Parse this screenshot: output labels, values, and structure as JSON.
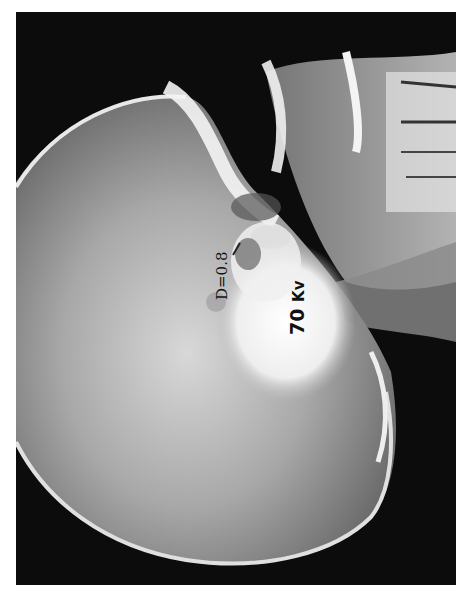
{
  "image": {
    "subject": "lateral skull radiograph",
    "background_color": "#ffffff",
    "film_color": "#0a0a0a",
    "bone_color": "#f2f2f2"
  },
  "annotations": {
    "density_label": "D=0.8",
    "kv_value": "70",
    "kv_unit": "Kv"
  }
}
